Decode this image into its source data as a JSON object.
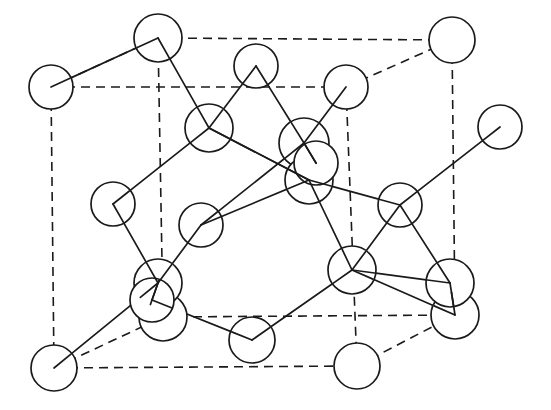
{
  "figure": {
    "kind": "crystal-lattice-diagram",
    "width": 551,
    "height": 410,
    "background_color": "#ffffff",
    "line_color": "#1a1a1a",
    "atom_fill_color": "#ffffff",
    "atom_stroke_width": 1.7,
    "bond_stroke_width": 1.7,
    "cell_edge_style": "dashed",
    "cell_edge_dasharray": "9 6",
    "atom_count": 22,
    "bond_count": 25,
    "cell_edge_count": 12
  },
  "atoms": [
    {
      "id": "corner-back-top-left",
      "label": "",
      "cx": 158,
      "cy": 38,
      "r": 24
    },
    {
      "id": "corner-back-top-right",
      "label": "",
      "cx": 452,
      "cy": 40,
      "r": 23
    },
    {
      "id": "corner-front-top-left",
      "label": "",
      "cx": 51,
      "cy": 87,
      "r": 22
    },
    {
      "id": "corner-front-top-right",
      "label": "",
      "cx": 346,
      "cy": 87,
      "r": 22
    },
    {
      "id": "corner-back-bottom-left",
      "label": "",
      "cx": 163,
      "cy": 317,
      "r": 24
    },
    {
      "id": "corner-back-bottom-right",
      "label": "",
      "cx": 455,
      "cy": 315,
      "r": 24
    },
    {
      "id": "corner-front-bottom-left",
      "label": "",
      "cx": 54,
      "cy": 368,
      "r": 23
    },
    {
      "id": "corner-front-bottom-right",
      "label": "",
      "cx": 357,
      "cy": 366,
      "r": 23
    },
    {
      "id": "face-top-center",
      "label": "",
      "cx": 256,
      "cy": 66,
      "r": 22
    },
    {
      "id": "face-left-upper",
      "label": "",
      "cx": 209,
      "cy": 128,
      "r": 24
    },
    {
      "id": "face-right-upper",
      "label": "",
      "cx": 304,
      "cy": 143,
      "r": 25
    },
    {
      "id": "face-center-mid",
      "label": "",
      "cx": 309,
      "cy": 180,
      "r": 24
    },
    {
      "id": "face-left-mid",
      "label": "",
      "cx": 113,
      "cy": 204,
      "r": 22
    },
    {
      "id": "face-center",
      "label": "",
      "cx": 201,
      "cy": 225,
      "r": 22
    },
    {
      "id": "face-right-mid",
      "label": "",
      "cx": 400,
      "cy": 205,
      "r": 22
    },
    {
      "id": "face-bottom-center",
      "label": "",
      "cx": 352,
      "cy": 270,
      "r": 24
    },
    {
      "id": "face-bottom-left",
      "label": "",
      "cx": 158,
      "cy": 283,
      "r": 24
    },
    {
      "id": "face-bottom-right",
      "label": "",
      "cx": 450,
      "cy": 283,
      "r": 24
    },
    {
      "id": "edge-right-outer",
      "label": "",
      "cx": 500,
      "cy": 127,
      "r": 22
    },
    {
      "id": "edge-bottom-mid",
      "label": "",
      "cx": 252,
      "cy": 340,
      "r": 23
    },
    {
      "id": "interior-lower-left",
      "label": "",
      "cx": 152,
      "cy": 300,
      "r": 22
    },
    {
      "id": "interior-upper-right",
      "label": "",
      "cx": 316,
      "cy": 163,
      "r": 22
    }
  ],
  "cell_edges": [
    {
      "id": "edge-back-top",
      "x1": 158,
      "y1": 38,
      "x2": 452,
      "y2": 40
    },
    {
      "id": "edge-back-left-vert",
      "x1": 158,
      "y1": 38,
      "x2": 163,
      "y2": 317
    },
    {
      "id": "edge-back-right-vert",
      "x1": 452,
      "y1": 40,
      "x2": 455,
      "y2": 315
    },
    {
      "id": "edge-back-bottom",
      "x1": 163,
      "y1": 317,
      "x2": 455,
      "y2": 315
    },
    {
      "id": "edge-front-top",
      "x1": 51,
      "y1": 87,
      "x2": 346,
      "y2": 87
    },
    {
      "id": "edge-front-left-vert",
      "x1": 51,
      "y1": 87,
      "x2": 54,
      "y2": 368
    },
    {
      "id": "edge-front-right-vert",
      "x1": 346,
      "y1": 87,
      "x2": 357,
      "y2": 366
    },
    {
      "id": "edge-front-bottom",
      "x1": 54,
      "y1": 368,
      "x2": 357,
      "y2": 366
    },
    {
      "id": "edge-diag-top-left",
      "x1": 51,
      "y1": 87,
      "x2": 158,
      "y2": 38
    },
    {
      "id": "edge-diag-top-right",
      "x1": 346,
      "y1": 87,
      "x2": 452,
      "y2": 40
    },
    {
      "id": "edge-diag-bottom-left",
      "x1": 54,
      "y1": 368,
      "x2": 163,
      "y2": 317
    },
    {
      "id": "edge-diag-bottom-right",
      "x1": 357,
      "y1": 366,
      "x2": 455,
      "y2": 315
    }
  ],
  "bonds": [
    {
      "id": "bond-01",
      "from": "corner-back-top-left",
      "to": "face-left-upper"
    },
    {
      "id": "bond-02",
      "from": "face-top-center",
      "to": "face-left-upper"
    },
    {
      "id": "bond-03",
      "from": "face-top-center",
      "to": "face-right-upper"
    },
    {
      "id": "bond-04",
      "from": "corner-front-top-right",
      "to": "face-right-upper"
    },
    {
      "id": "bond-05",
      "from": "face-left-upper",
      "to": "face-center-mid"
    },
    {
      "id": "bond-06",
      "from": "face-right-upper",
      "to": "face-center"
    },
    {
      "id": "bond-07",
      "from": "face-left-upper",
      "to": "face-left-mid"
    },
    {
      "id": "bond-08",
      "from": "face-center-mid",
      "to": "face-right-mid"
    },
    {
      "id": "bond-09",
      "from": "face-center-mid",
      "to": "face-bottom-center"
    },
    {
      "id": "bond-10",
      "from": "face-left-mid",
      "to": "face-bottom-left"
    },
    {
      "id": "bond-11",
      "from": "face-center",
      "to": "face-bottom-left"
    },
    {
      "id": "bond-12",
      "from": "face-right-mid",
      "to": "edge-right-outer"
    },
    {
      "id": "bond-13",
      "from": "face-right-mid",
      "to": "face-bottom-center"
    },
    {
      "id": "bond-14",
      "from": "face-right-mid",
      "to": "face-bottom-right"
    },
    {
      "id": "bond-15",
      "from": "face-bottom-center",
      "to": "edge-bottom-mid"
    },
    {
      "id": "bond-16",
      "from": "face-bottom-center",
      "to": "face-bottom-right"
    },
    {
      "id": "bond-17",
      "from": "face-bottom-left",
      "to": "corner-front-bottom-left"
    },
    {
      "id": "bond-18",
      "from": "interior-lower-left",
      "to": "edge-bottom-mid"
    },
    {
      "id": "bond-19",
      "from": "face-bottom-left",
      "to": "interior-lower-left"
    },
    {
      "id": "bond-20",
      "from": "face-left-upper",
      "to": "face-center-mid"
    },
    {
      "id": "bond-21",
      "from": "corner-back-top-left",
      "to": "corner-front-top-left"
    },
    {
      "id": "bond-22",
      "from": "face-bottom-right",
      "to": "corner-back-bottom-right"
    },
    {
      "id": "bond-23",
      "from": "interior-upper-right",
      "to": "face-right-upper"
    },
    {
      "id": "bond-24",
      "from": "face-center-mid",
      "to": "face-center"
    },
    {
      "id": "bond-25",
      "from": "face-bottom-center",
      "to": "corner-back-bottom-right"
    }
  ],
  "bond_segments": [
    {
      "id": "seg-01",
      "x1": 168,
      "y1": 55,
      "x2": 199,
      "y2": 112
    },
    {
      "id": "seg-02",
      "x1": 240,
      "y1": 78,
      "x2": 225,
      "y2": 118
    },
    {
      "id": "seg-03",
      "x1": 266,
      "y1": 83,
      "x2": 294,
      "y2": 124
    },
    {
      "id": "seg-04",
      "x1": 336,
      "y1": 104,
      "x2": 318,
      "y2": 126
    },
    {
      "id": "seg-05",
      "x1": 226,
      "y1": 142,
      "x2": 290,
      "y2": 172
    },
    {
      "id": "seg-06",
      "x1": 288,
      "y1": 161,
      "x2": 216,
      "y2": 212
    },
    {
      "id": "seg-07",
      "x1": 192,
      "y1": 143,
      "x2": 127,
      "y2": 188
    },
    {
      "id": "seg-08",
      "x1": 332,
      "y1": 189,
      "x2": 379,
      "y2": 201
    },
    {
      "id": "seg-09",
      "x1": 318,
      "y1": 203,
      "x2": 345,
      "y2": 247
    },
    {
      "id": "seg-10",
      "x1": 117,
      "y1": 226,
      "x2": 150,
      "y2": 262
    },
    {
      "id": "seg-11",
      "x1": 193,
      "y1": 246,
      "x2": 173,
      "y2": 263
    },
    {
      "id": "seg-12",
      "x1": 417,
      "y1": 190,
      "x2": 481,
      "y2": 141
    },
    {
      "id": "seg-13",
      "x1": 396,
      "y1": 227,
      "x2": 368,
      "y2": 251
    },
    {
      "id": "seg-14",
      "x1": 414,
      "y1": 218,
      "x2": 438,
      "y2": 263
    },
    {
      "id": "seg-15",
      "x1": 336,
      "y1": 288,
      "x2": 271,
      "y2": 326
    },
    {
      "id": "seg-16",
      "x1": 374,
      "y1": 280,
      "x2": 428,
      "y2": 290
    },
    {
      "id": "seg-17",
      "x1": 142,
      "y1": 300,
      "x2": 72,
      "y2": 353
    },
    {
      "id": "seg-18",
      "x1": 174,
      "y1": 306,
      "x2": 230,
      "y2": 334
    },
    {
      "id": "seg-19",
      "x1": 147,
      "y1": 307,
      "x2": 72,
      "y2": 356
    },
    {
      "id": "seg-20",
      "x1": 279,
      "y1": 158,
      "x2": 228,
      "y2": 132
    },
    {
      "id": "seg-21",
      "x1": 136,
      "y1": 48,
      "x2": 70,
      "y2": 78
    },
    {
      "id": "seg-22",
      "x1": 443,
      "y1": 306,
      "x2": 437,
      "y2": 296
    },
    {
      "id": "seg-23",
      "x1": 296,
      "y1": 157,
      "x2": 281,
      "y2": 152
    },
    {
      "id": "seg-24",
      "x1": 293,
      "y1": 161,
      "x2": 277,
      "y2": 172
    },
    {
      "id": "seg-25",
      "x1": 370,
      "y1": 282,
      "x2": 432,
      "y2": 303
    }
  ]
}
